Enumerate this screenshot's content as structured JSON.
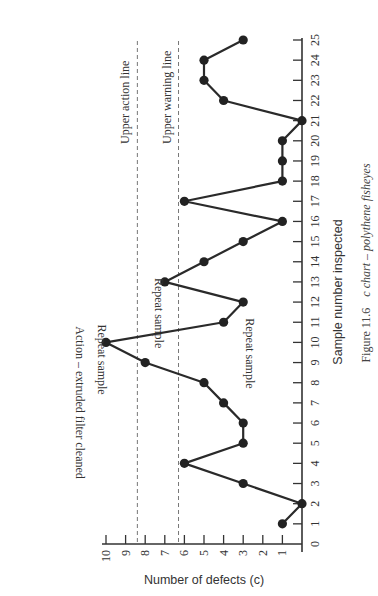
{
  "chart_data": {
    "type": "line",
    "title": "",
    "xlabel": "Sample number inspected",
    "ylabel": "Number of defects (c)",
    "x": [
      1,
      2,
      3,
      4,
      5,
      6,
      7,
      8,
      9,
      10,
      11,
      12,
      13,
      14,
      15,
      16,
      17,
      18,
      19,
      20,
      21,
      22,
      23,
      24,
      25
    ],
    "values": [
      1,
      0,
      3,
      6,
      3,
      3,
      4,
      5,
      8,
      10,
      4,
      3,
      7,
      5,
      3,
      1,
      6,
      1,
      1,
      1,
      0,
      4,
      5,
      5,
      3
    ],
    "x_ticks": [
      "0",
      "1",
      "2",
      "3",
      "4",
      "5",
      "6",
      "7",
      "8",
      "9",
      "10",
      "11",
      "12",
      "13",
      "14",
      "15",
      "16",
      "17",
      "18",
      "19",
      "20",
      "21",
      "22",
      "23",
      "24",
      "25"
    ],
    "y_ticks": [
      "0",
      "1",
      "2",
      "3",
      "4",
      "5",
      "6",
      "7",
      "8",
      "9",
      "10"
    ],
    "xlim": [
      0,
      25
    ],
    "ylim": [
      0,
      10
    ],
    "grid": false,
    "reference_lines": [
      {
        "name": "Upper action line",
        "value": 8.4,
        "style": "dashed"
      },
      {
        "name": "Upper warning line",
        "value": 6.3,
        "style": "dashed"
      }
    ],
    "annotations": [
      {
        "x": 10,
        "text": "Repeat sample"
      },
      {
        "x": 11,
        "text": "Action – extruded filter cleaned"
      },
      {
        "x": 11,
        "text": "Repeat sample"
      },
      {
        "x": 13,
        "text": "Repeat sample"
      }
    ],
    "orientation": "rotated 90° counter-clockwise on page"
  },
  "figure": {
    "caption_prefix": "Figure 11.6",
    "caption_text": "c chart – polythene fisheyes"
  }
}
